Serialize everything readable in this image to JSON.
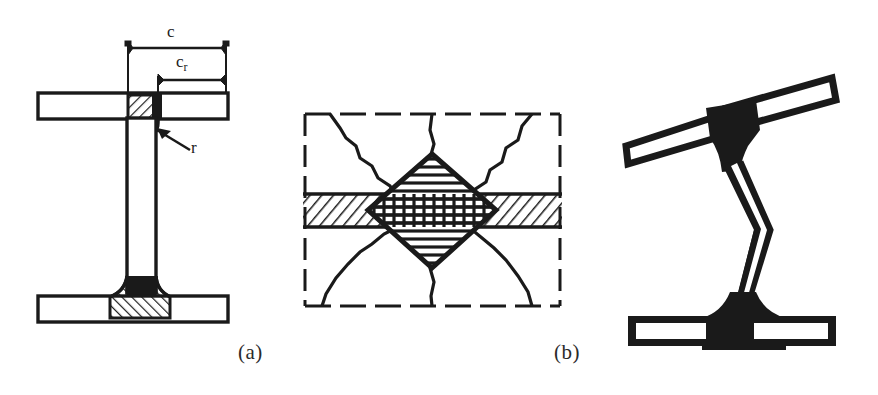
{
  "figure": {
    "background_color": "#ffffff",
    "ink_color": "#1a1a1a",
    "captions": [
      {
        "id": "a",
        "text": "(a)",
        "x": 238,
        "y": 342
      },
      {
        "id": "b",
        "text": "(b)",
        "x": 556,
        "y": 342
      }
    ],
    "panels": [
      {
        "id": "panel-a",
        "name": "i-beam-cross-section",
        "caption": "(a)",
        "labels": {
          "overall_width": "c",
          "reduced_width_main": "c",
          "reduced_width_sub": "r",
          "fillet_radius": "r"
        },
        "parts": [
          "top-flange",
          "bottom-flange",
          "web",
          "top-fillet-hatched",
          "bottom-fillet-hatched",
          "dimension-line-c",
          "dimension-line-cr",
          "leader-line-r"
        ]
      },
      {
        "id": "panel-b",
        "name": "plastic-zone-weld-diagram",
        "caption": "(b)",
        "parts": [
          "dashed-boundary-box",
          "horizontal-hatched-band",
          "central-diamond-crosshatched",
          "radiating-yield-lines"
        ]
      },
      {
        "id": "panel-c",
        "name": "distorted-buckled-beam",
        "caption": "",
        "parts": [
          "tilted-top-flange",
          "kinked-web",
          "bottom-flange",
          "solid-black-junctions"
        ]
      }
    ]
  }
}
